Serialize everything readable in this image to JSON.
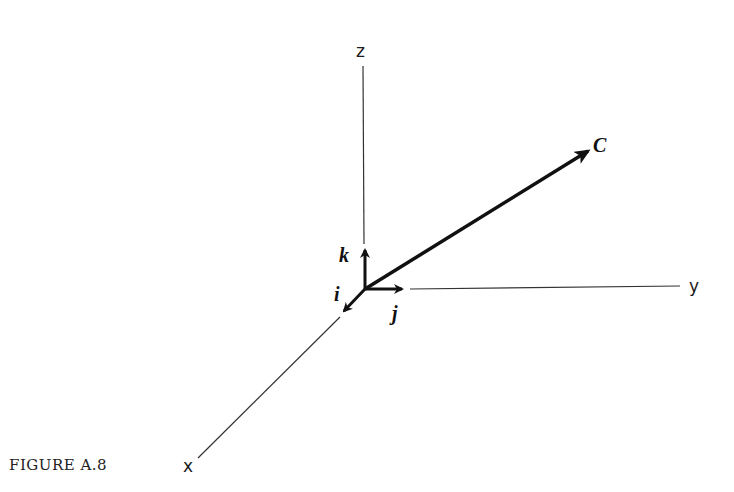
{
  "figure": {
    "caption": "FIGURE A.8",
    "axes": {
      "x": "x",
      "y": "y",
      "z": "z"
    },
    "unit_vectors": {
      "i": "i",
      "j": "j",
      "k": "k"
    },
    "vector": {
      "label": "C"
    },
    "colors": {
      "ink": "#111111",
      "background": "#ffffff"
    }
  }
}
